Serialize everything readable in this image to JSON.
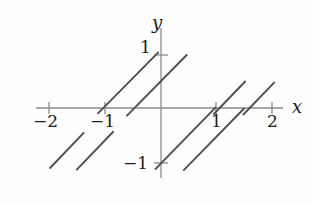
{
  "figure": {
    "kind": "cartesian-plot",
    "background_color": "#fefefe",
    "axis_color": "#8a8a8a",
    "curve_color": "#4f4f4f",
    "label_color": "#1c1c1c"
  },
  "axes": {
    "x_label": "x",
    "y_label": "y",
    "x_ticks": [
      {
        "value": -2,
        "label": "−2",
        "px": 49
      },
      {
        "value": -1,
        "label": "−1",
        "px": 105
      },
      {
        "value": 1,
        "label": "1",
        "px": 216
      },
      {
        "value": 2,
        "label": "2",
        "px": 272
      }
    ],
    "y_ticks": [
      {
        "value": 1,
        "label": "1",
        "px": 55
      },
      {
        "value": -1,
        "label": "−1",
        "px": 163
      }
    ],
    "origin_px": {
      "x": 161,
      "y": 108
    },
    "unit_px": {
      "x": 55.7,
      "y": 54.0
    }
  },
  "chart_data": {
    "type": "line",
    "title": "",
    "xlabel": "x",
    "ylabel": "y",
    "xlim": [
      -2.3,
      2.4
    ],
    "ylim": [
      -1.45,
      1.2
    ],
    "grid": false,
    "legend": null,
    "xticks": [
      -2,
      -1,
      1,
      2
    ],
    "xticklabels": [
      "−2",
      "−1",
      "1",
      "2"
    ],
    "yticks": [
      1,
      -1
    ],
    "yticklabels": [
      "1",
      "−1"
    ],
    "segments": [
      {
        "name": "segment-1",
        "x0": -2.0,
        "y0": -1.12,
        "x1": -1.38,
        "y1": -0.45
      },
      {
        "name": "segment-2",
        "x0": -1.52,
        "y0": -1.15,
        "x1": -0.85,
        "y1": -0.43
      },
      {
        "name": "segment-3",
        "x0": -1.14,
        "y0": -0.11,
        "x1": -0.04,
        "y1": 1.04
      },
      {
        "name": "segment-4",
        "x0": -0.62,
        "y0": -0.15,
        "x1": 0.47,
        "y1": 0.99
      },
      {
        "name": "segment-5",
        "x0": -0.11,
        "y0": -1.14,
        "x1": 0.99,
        "y1": 0.02
      },
      {
        "name": "segment-6",
        "x0": 0.4,
        "y0": -1.16,
        "x1": 1.5,
        "y1": 0.0
      },
      {
        "name": "segment-7",
        "x0": 0.94,
        "y0": -0.12,
        "x1": 1.52,
        "y1": 0.5
      },
      {
        "name": "segment-8",
        "x0": 1.47,
        "y0": -0.13,
        "x1": 2.04,
        "y1": 0.48
      }
    ]
  }
}
